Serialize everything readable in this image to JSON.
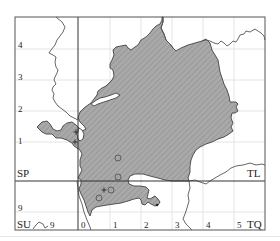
{
  "map": {
    "colors": {
      "frame": "#555555",
      "major_grid": "#333333",
      "minor_grid": "#e4e4e4",
      "fill": "#a9a9a9",
      "hatch": "#8c8c8c",
      "outline": "#444444",
      "river": "#555555",
      "marker": "#555555"
    },
    "frame": {
      "x": 15,
      "y": 17,
      "w": 250,
      "h": 213
    },
    "major_lines": {
      "vertical_x": 78,
      "horizontal_y": 181
    },
    "minor_grid": {
      "vertical": [
        110,
        141,
        172,
        203,
        234
      ],
      "horizontal": [
        49,
        80,
        111,
        142,
        212
      ]
    },
    "square_labels": [
      {
        "id": "sp",
        "text": "SP",
        "x": 17,
        "y": 177,
        "size": 11
      },
      {
        "id": "tl",
        "text": "TL",
        "x": 247,
        "y": 177,
        "size": 11
      },
      {
        "id": "su",
        "text": "SU",
        "x": 17,
        "y": 228,
        "size": 11
      },
      {
        "id": "tq",
        "text": "TQ",
        "x": 247,
        "y": 228,
        "size": 11
      }
    ],
    "y_tick_labels": [
      {
        "text": "4",
        "x": 18,
        "y": 48
      },
      {
        "text": "3",
        "x": 18,
        "y": 80
      },
      {
        "text": "2",
        "x": 18,
        "y": 112
      },
      {
        "text": "1",
        "x": 18,
        "y": 144
      },
      {
        "text": "9",
        "x": 18,
        "y": 211
      }
    ],
    "x_tick_labels": [
      {
        "text": "9",
        "x": 50,
        "y": 228
      },
      {
        "text": "0",
        "x": 81,
        "y": 228
      },
      {
        "text": "1",
        "x": 113,
        "y": 228
      },
      {
        "text": "2",
        "x": 144,
        "y": 228
      },
      {
        "text": "3",
        "x": 175,
        "y": 228
      },
      {
        "text": "4",
        "x": 206,
        "y": 228
      },
      {
        "text": "5",
        "x": 237,
        "y": 228
      }
    ],
    "region_path": "M37,127 L42,122 L47,121 L50,124 L53,129 L57,131 L61,130 L63,126 L67,123 L72,122 L76,125 L79,128 L82,131 L86,129 L84,126 L80,122 L78,118 L80,112 L84,108 L88,105 L91,103 L94,99 L97,95 L98,91 L102,88 L106,86 L109,83 L112,80 L114,76 L113,70 L110,68 L110,64 L112,60 L114,55 L113,50 L116,47 L121,46 L126,45 L128,48 L131,50 L135,47 L138,45 L141,40 L146,37 L150,33 L153,29 L156,26 L160,24 L162,20 L162,17 L163,17 L163,22 L161,28 L164,34 L166,40 L170,44 L173,48 L176,51 L181,48 L188,45 L195,43 L202,41 L206,39 L210,43 L212,50 L215,55 L218,60 L219,66 L220,72 L222,78 L224,84 L227,90 L229,96 L230,102 L236,102 L238,104 L236,107 L238,111 L235,113 L232,113 L231,118 L233,123 L231,127 L233,131 L229,134 L224,137 L218,139 L212,142 L206,144 L200,147 L196,150 L193,155 L191,160 L190,166 L190,172 L188,178 L189,181 L181,181 L172,181 L165,180 L158,178 L150,176 L143,174 L135,174 L130,176 L128,180 L129,184 L134,186 L140,186 L146,187 L149,190 L148,194 L147,198 L150,199 L155,196 L158,199 L160,202 L158,205 L155,206 L151,204 L148,202 L145,205 L142,204 L141,200 L139,198 L134,199 L128,201 L121,203 L114,204 L107,205 L101,206 L96,207 L92,210 L91,213 L90,216 L88,212 L86,206 L84,200 L81,194 L79,189 L81,184 L81,180 L78,178 L80,174 L82,170 L80,166 L80,160 L82,154 L80,150 L77,148 L74,146 L72,143 L67,140 L61,138 L56,138 L52,134 L46,134 L42,132 Z",
    "hole_paths": [
      "M79,128 L82,130 L84,134 L83,139 L80,141 L78,139 L77,134 Z",
      "M91,104 L95,101 L100,98 L105,97 L111,95 L116,93 L120,95 L116,98 L110,100 L104,102 L98,104 L94,106 Z"
    ],
    "rivers": [
      "M56,17 L62,22 L65,27 L63,32 L60,36 L57,40 L55,45 L51,50 L49,53 L53,55 L56,57 L55,62 L56,67 L58,70 L57,73 L55,77 L54,80 L56,84 L53,87 L52,90 L54,94 L53,98 L55,102 L58,106 L62,109 L66,112 L70,116 L74,118 L78,120",
      "M163,17 L163,22 L161,28 L164,34 L166,40 L170,44 L173,48 L176,51",
      "M202,41 L206,40 L210,41 L214,43 L218,44 L221,41 L224,43 L227,46 L230,44 L233,41 L236,42 L238,39 L240,35 L244,34 L246,31 L250,32 L255,29 L258,31 L261,33 L264,36 L265,40",
      "M189,181 L195,180 L200,182 L206,184 L210,181 L215,178 L220,175 L226,172 L231,168 L236,166 L243,165 L250,163 L256,165 L262,164 L265,165",
      "M189,181 L190,188 L188,195 L189,201 L187,208 L185,214 L183,219 L186,224 L190,228 L192,230",
      "M77,181 L78,188 L79,196 L82,204 L84,212 L87,220 L90,227 L91,230",
      "M33,229 L36,225 L39,222 L43,224 L45,228 L48,226"
    ],
    "markers": {
      "circles": [
        {
          "cx": 118,
          "cy": 158,
          "r": 3
        },
        {
          "cx": 118,
          "cy": 177,
          "r": 3
        },
        {
          "cx": 111,
          "cy": 190,
          "r": 3
        },
        {
          "cx": 99,
          "cy": 198,
          "r": 3
        }
      ],
      "pluses": [
        {
          "x": 104,
          "y": 190
        },
        {
          "x": 75,
          "y": 142
        },
        {
          "x": 76,
          "y": 132
        }
      ],
      "dots": [
        {
          "x": 157,
          "y": 205
        }
      ]
    }
  }
}
